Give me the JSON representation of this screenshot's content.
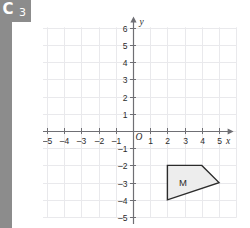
{
  "badge": {
    "letter": "C",
    "number": "3"
  },
  "chart_data": {
    "type": "scatter",
    "title": "",
    "xlabel": "x",
    "ylabel": "y",
    "xlim": [
      -6,
      6
    ],
    "ylim": [
      -5.8,
      6.8
    ],
    "grid": true,
    "legend": "none",
    "origin_label": "O",
    "x_ticks": [
      -5,
      -4,
      -3,
      -2,
      -1,
      1,
      2,
      3,
      4,
      5
    ],
    "x_tick_labels": [
      "–5",
      "–4",
      "–3",
      "–2",
      "–1",
      "1",
      "2",
      "3",
      "4",
      "5"
    ],
    "y_ticks": [
      6,
      5,
      4,
      3,
      2,
      1,
      -1,
      -2,
      -3,
      -4,
      -5
    ],
    "y_tick_labels": [
      "6",
      "5",
      "4",
      "3",
      "2",
      "1",
      "–1",
      "–2",
      "–3",
      "–4",
      "–5"
    ],
    "shapes": [
      {
        "name": "M",
        "label": "M",
        "type": "polygon",
        "vertices": [
          [
            2,
            -2
          ],
          [
            4,
            -2
          ],
          [
            5,
            -3
          ],
          [
            2,
            -4
          ]
        ],
        "label_position": [
          2.9,
          -3.0
        ],
        "fill": "#ededed",
        "stroke": "#2b2b2b"
      }
    ]
  },
  "colors": {
    "grid": "#e9e9ec",
    "axis": "#6f6f74",
    "text": "#2b2b2b",
    "sidebar": "#8c8c8c",
    "shape_fill": "#ededed",
    "shape_stroke": "#2b2b2b",
    "background": "#ffffff"
  }
}
